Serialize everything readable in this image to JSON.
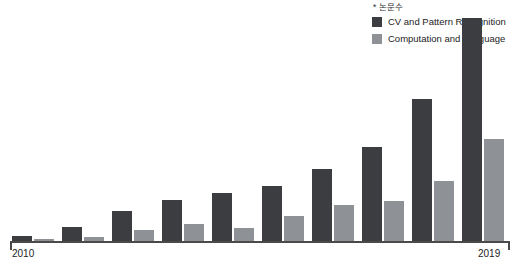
{
  "annotation": "* 논문수",
  "legend": {
    "position": "top-right",
    "items": [
      {
        "label": "CV and Pattern Recognition",
        "color": "#3c3d41",
        "icon": "legend-swatch-icon"
      },
      {
        "label": "Computation and Language",
        "color": "#8e9196",
        "icon": "legend-swatch-icon"
      }
    ]
  },
  "axis": {
    "first_tick": "2010",
    "last_tick": "2019",
    "line_color": "#4a4a4a"
  },
  "chart_data": {
    "type": "bar",
    "title": "",
    "subtitle": "",
    "xlabel": "",
    "ylabel": "",
    "annotation": "* 논문수",
    "grid": false,
    "legend_position": "top-right",
    "ylim": [
      0,
      200
    ],
    "categories": [
      "2010",
      "2011",
      "2012",
      "2013",
      "2014",
      "2015",
      "2016",
      "2017",
      "2018",
      "2019"
    ],
    "tick_labels_shown": [
      "2010",
      "2019"
    ],
    "series": [
      {
        "name": "CV and Pattern Recognition",
        "color": "#3c3d41",
        "values": [
          4,
          12,
          25,
          34,
          40,
          46,
          60,
          78,
          118,
          185
        ]
      },
      {
        "name": "Computation and Language",
        "color": "#8e9196",
        "values": [
          2,
          3,
          9,
          14,
          11,
          21,
          30,
          33,
          50,
          85
        ]
      }
    ]
  }
}
